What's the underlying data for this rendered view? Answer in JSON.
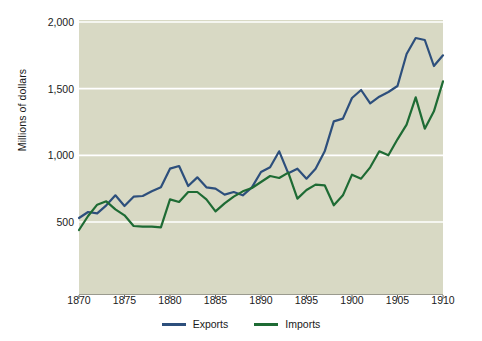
{
  "chart_data": {
    "type": "line",
    "title": "",
    "xlabel": "",
    "ylabel": "Millions of dollars",
    "xlim": [
      1870,
      1910
    ],
    "ylim": [
      0,
      2000
    ],
    "xticks": [
      1870,
      1875,
      1880,
      1885,
      1890,
      1895,
      1900,
      1905,
      1910
    ],
    "xtick_labels": [
      "1870",
      "1875",
      "1880",
      "1885",
      "1890",
      "1895",
      "1900",
      "1905",
      "1910"
    ],
    "yticks": [
      500,
      1000,
      1500,
      2000
    ],
    "ytick_labels": [
      "500",
      "1,000",
      "1,500",
      "2,000"
    ],
    "grid": "horizontal",
    "legend_position": "bottom-center",
    "plot_background": "#d8d9c4",
    "gridline_color": "#ffffff",
    "x": [
      1870,
      1871,
      1872,
      1873,
      1874,
      1875,
      1876,
      1877,
      1878,
      1879,
      1880,
      1881,
      1882,
      1883,
      1884,
      1885,
      1886,
      1887,
      1888,
      1889,
      1890,
      1891,
      1892,
      1893,
      1894,
      1895,
      1896,
      1897,
      1898,
      1899,
      1900,
      1901,
      1902,
      1903,
      1904,
      1905,
      1906,
      1907,
      1908,
      1909,
      1910
    ],
    "series": [
      {
        "name": "Exports",
        "color": "#2d4f7c",
        "values": [
          530,
          575,
          565,
          625,
          700,
          620,
          690,
          695,
          730,
          760,
          900,
          920,
          770,
          835,
          760,
          750,
          705,
          725,
          700,
          760,
          875,
          910,
          1030,
          865,
          900,
          825,
          900,
          1030,
          1255,
          1275,
          1430,
          1490,
          1390,
          1440,
          1475,
          1520,
          1760,
          1880,
          1865,
          1670,
          1750
        ]
      },
      {
        "name": "Imports",
        "color": "#1e6b34",
        "values": [
          440,
          545,
          630,
          655,
          595,
          550,
          470,
          465,
          465,
          460,
          670,
          650,
          725,
          725,
          670,
          580,
          640,
          690,
          730,
          755,
          800,
          845,
          830,
          870,
          675,
          740,
          780,
          775,
          625,
          700,
          855,
          825,
          910,
          1030,
          1000,
          1120,
          1230,
          1435,
          1200,
          1330,
          1555
        ]
      }
    ]
  }
}
